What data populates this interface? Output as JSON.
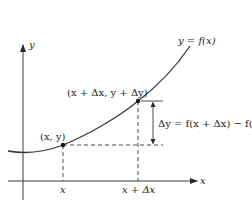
{
  "diagram": {
    "colors": {
      "curve": "#3a3a3a",
      "axes": "#3a3a3a",
      "dashed": "#3a3a3a",
      "text": "#222222",
      "background": "#ffffff"
    },
    "axes": {
      "x_label": "x",
      "y_label": "y"
    },
    "curve_label": "y = f(x)",
    "points": [
      {
        "id": "p1",
        "label": "(x, y)",
        "x_tick": "x"
      },
      {
        "id": "p2",
        "label": "(x + Δx, y + Δy)",
        "x_tick": "x + Δx"
      }
    ],
    "delta_y_label": "Δy = f(x + Δx) − f(x)"
  }
}
